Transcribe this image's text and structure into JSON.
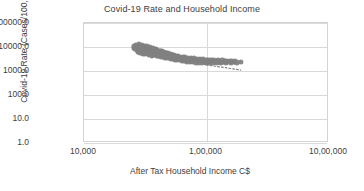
{
  "chart_data": {
    "type": "scatter",
    "title": "Covid-19 Rate and Household Income",
    "xlabel": "After Tax Household Income C$",
    "ylabel": "Covid-19 Rate (Cases/100,000)",
    "xscale": "log",
    "yscale": "log",
    "xlim": [
      10000,
      1000000
    ],
    "ylim": [
      1,
      100000
    ],
    "grid": true,
    "legend": false,
    "marker_color": "#808080",
    "gridline_color": "#d9d9d9",
    "trendline": {
      "style": "dotted",
      "color": "#808080",
      "x": [
        100000,
        190000
      ],
      "y": [
        1800,
        1100
      ]
    },
    "xticks": [
      {
        "value": 10000,
        "label": "10,000"
      },
      {
        "value": 100000,
        "label": "1,00,000"
      },
      {
        "value": 1000000,
        "label": "10,00,000"
      }
    ],
    "yticks": [
      {
        "value": 1,
        "label": "1.0"
      },
      {
        "value": 10,
        "label": "10.0"
      },
      {
        "value": 100,
        "label": "100.0"
      },
      {
        "value": 1000,
        "label": "1000.0"
      },
      {
        "value": 10000,
        "label": "10000.0"
      },
      {
        "value": 100000,
        "label": "100000.0"
      }
    ],
    "points": [
      [
        25500,
        9200
      ],
      [
        25800,
        11000
      ],
      [
        26200,
        8300
      ],
      [
        26500,
        12500
      ],
      [
        26900,
        7600
      ],
      [
        27100,
        10200
      ],
      [
        27400,
        6400
      ],
      [
        27600,
        9000
      ],
      [
        27900,
        13000
      ],
      [
        28100,
        7000
      ],
      [
        28300,
        8600
      ],
      [
        28600,
        5600
      ],
      [
        28800,
        10500
      ],
      [
        29000,
        6900
      ],
      [
        29200,
        8000
      ],
      [
        29500,
        12000
      ],
      [
        29700,
        6100
      ],
      [
        29900,
        9600
      ],
      [
        30100,
        7300
      ],
      [
        30300,
        5200
      ],
      [
        30600,
        8900
      ],
      [
        30800,
        11500
      ],
      [
        31000,
        6500
      ],
      [
        31200,
        7800
      ],
      [
        31400,
        5000
      ],
      [
        31700,
        9400
      ],
      [
        31900,
        6700
      ],
      [
        32100,
        8200
      ],
      [
        32300,
        10800
      ],
      [
        32600,
        5800
      ],
      [
        32800,
        7100
      ],
      [
        33000,
        9000
      ],
      [
        33200,
        6000
      ],
      [
        33500,
        7600
      ],
      [
        33700,
        4700
      ],
      [
        33900,
        8500
      ],
      [
        34100,
        6300
      ],
      [
        34300,
        9800
      ],
      [
        34600,
        5400
      ],
      [
        34800,
        7000
      ],
      [
        35000,
        8100
      ],
      [
        35300,
        5900
      ],
      [
        35500,
        6600
      ],
      [
        35800,
        7400
      ],
      [
        36000,
        4500
      ],
      [
        36300,
        8800
      ],
      [
        36500,
        5700
      ],
      [
        36800,
        6900
      ],
      [
        37000,
        7900
      ],
      [
        37300,
        4900
      ],
      [
        37600,
        6200
      ],
      [
        37900,
        7200
      ],
      [
        38100,
        5300
      ],
      [
        38400,
        8400
      ],
      [
        38700,
        5900
      ],
      [
        39000,
        6700
      ],
      [
        39300,
        4400
      ],
      [
        39600,
        7500
      ],
      [
        39900,
        5500
      ],
      [
        40200,
        6400
      ],
      [
        40500,
        4200
      ],
      [
        40800,
        7100
      ],
      [
        41100,
        5100
      ],
      [
        41400,
        6000
      ],
      [
        41700,
        4600
      ],
      [
        42000,
        6800
      ],
      [
        42400,
        5200
      ],
      [
        42700,
        4000
      ],
      [
        43000,
        5800
      ],
      [
        43400,
        6500
      ],
      [
        43700,
        4800
      ],
      [
        44000,
        5400
      ],
      [
        44400,
        3900
      ],
      [
        44800,
        6100
      ],
      [
        45100,
        4500
      ],
      [
        45500,
        5200
      ],
      [
        45900,
        3700
      ],
      [
        46300,
        5700
      ],
      [
        46700,
        4300
      ],
      [
        47100,
        5000
      ],
      [
        47500,
        3600
      ],
      [
        47900,
        5500
      ],
      [
        48300,
        4100
      ],
      [
        48700,
        4800
      ],
      [
        49100,
        3500
      ],
      [
        49600,
        5200
      ],
      [
        50000,
        3900
      ],
      [
        50500,
        4500
      ],
      [
        51000,
        3300
      ],
      [
        51500,
        4900
      ],
      [
        52000,
        3700
      ],
      [
        52500,
        4300
      ],
      [
        53000,
        3200
      ],
      [
        53600,
        4600
      ],
      [
        54100,
        3500
      ],
      [
        54700,
        4100
      ],
      [
        55200,
        3000
      ],
      [
        55800,
        4400
      ],
      [
        56400,
        3300
      ],
      [
        57000,
        3900
      ],
      [
        57600,
        2900
      ],
      [
        58200,
        4200
      ],
      [
        58900,
        3200
      ],
      [
        59500,
        3700
      ],
      [
        60200,
        2800
      ],
      [
        60900,
        4000
      ],
      [
        61600,
        3100
      ],
      [
        62300,
        3500
      ],
      [
        63000,
        2700
      ],
      [
        63800,
        3800
      ],
      [
        64500,
        3000
      ],
      [
        65300,
        3400
      ],
      [
        66100,
        2600
      ],
      [
        66900,
        3700
      ],
      [
        67800,
        2900
      ],
      [
        68600,
        3300
      ],
      [
        69500,
        2500
      ],
      [
        70400,
        3600
      ],
      [
        71300,
        2800
      ],
      [
        72300,
        3200
      ],
      [
        73200,
        2400
      ],
      [
        74200,
        3500
      ],
      [
        75200,
        2700
      ],
      [
        76300,
        3100
      ],
      [
        77300,
        2350
      ],
      [
        78400,
        3400
      ],
      [
        79500,
        2650
      ],
      [
        80600,
        3000
      ],
      [
        81800,
        2300
      ],
      [
        83000,
        3300
      ],
      [
        84200,
        2600
      ],
      [
        85500,
        2950
      ],
      [
        86800,
        2280
      ],
      [
        88100,
        3200
      ],
      [
        89400,
        2550
      ],
      [
        90800,
        2900
      ],
      [
        92300,
        2250
      ],
      [
        93700,
        3100
      ],
      [
        95200,
        2500
      ],
      [
        96800,
        2850
      ],
      [
        98400,
        2220
      ],
      [
        100000,
        3000
      ],
      [
        101700,
        2480
      ],
      [
        103400,
        2800
      ],
      [
        105200,
        2200
      ],
      [
        107000,
        2950
      ],
      [
        108900,
        2450
      ],
      [
        110900,
        2750
      ],
      [
        112900,
        2180
      ],
      [
        115000,
        2880
      ],
      [
        117200,
        2420
      ],
      [
        119400,
        2700
      ],
      [
        121700,
        2150
      ],
      [
        124100,
        2820
      ],
      [
        126600,
        2400
      ],
      [
        129200,
        2650
      ],
      [
        131900,
        2130
      ],
      [
        134700,
        2760
      ],
      [
        137600,
        2380
      ],
      [
        140600,
        2600
      ],
      [
        143800,
        2120
      ],
      [
        147100,
        2700
      ],
      [
        150500,
        2350
      ],
      [
        154100,
        2560
      ],
      [
        157800,
        2100
      ],
      [
        161700,
        2650
      ],
      [
        165800,
        2330
      ],
      [
        170000,
        2520
      ],
      [
        178000,
        2300
      ],
      [
        190000,
        2400
      ]
    ]
  }
}
